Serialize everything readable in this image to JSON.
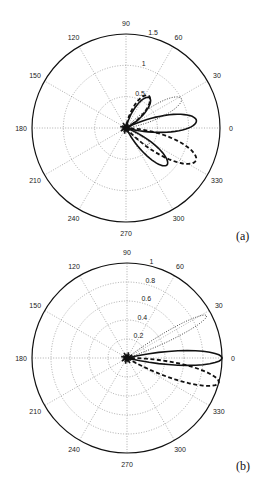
{
  "chart_data": [
    {
      "panel": "(a)",
      "type": "polar-line",
      "title": "",
      "angle_ticks": [
        "0",
        "30",
        "60",
        "90",
        "120",
        "150",
        "180",
        "210",
        "240",
        "270",
        "300",
        "330"
      ],
      "radial_ticks": [
        "0.5",
        "1",
        "1.5"
      ],
      "rmax": 1.5,
      "grid": true,
      "series": [
        {
          "name": "solid",
          "style": "solid",
          "lobes": [
            {
              "angle_deg": 6,
              "peak": 1.13,
              "half_width_deg": 11
            },
            {
              "angle_deg": -42,
              "peak": 0.88,
              "half_width_deg": 11
            },
            {
              "angle_deg": 52,
              "peak": 0.61,
              "half_width_deg": 13
            }
          ]
        },
        {
          "name": "dashed",
          "style": "dashed",
          "lobes": [
            {
              "angle_deg": -25,
              "peak": 1.23,
              "half_width_deg": 12
            },
            {
              "angle_deg": 55,
              "peak": 0.63,
              "half_width_deg": 14
            }
          ]
        },
        {
          "name": "dotted",
          "style": "dotted",
          "lobes": [
            {
              "angle_deg": 28,
              "peak": 1.0,
              "half_width_deg": 10
            },
            {
              "angle_deg": -35,
              "peak": 0.45,
              "half_width_deg": 10
            }
          ]
        }
      ]
    },
    {
      "panel": "(b)",
      "type": "polar-line",
      "title": "",
      "angle_ticks": [
        "0",
        "30",
        "60",
        "90",
        "120",
        "150",
        "180",
        "210",
        "240",
        "270",
        "300",
        "330"
      ],
      "radial_ticks": [
        "0.2",
        "0.4",
        "0.6",
        "0.8",
        "1"
      ],
      "rmax": 1.0,
      "grid": true,
      "series": [
        {
          "name": "solid",
          "style": "solid",
          "lobes": [
            {
              "angle_deg": 0,
              "peak": 1.0,
              "half_width_deg": 7
            }
          ]
        },
        {
          "name": "dashed",
          "style": "dashed",
          "lobes": [
            {
              "angle_deg": -15,
              "peak": 1.0,
              "half_width_deg": 8
            }
          ]
        },
        {
          "name": "dotted",
          "style": "dotted",
          "lobes": [
            {
              "angle_deg": 28,
              "peak": 0.95,
              "half_width_deg": 5
            }
          ]
        }
      ]
    }
  ],
  "panels": {
    "a": {
      "label": "(a)",
      "cx": 126,
      "cy": 128,
      "r": 94
    },
    "b": {
      "label": "(b)",
      "cx": 127,
      "cy": 358,
      "r": 95
    }
  }
}
